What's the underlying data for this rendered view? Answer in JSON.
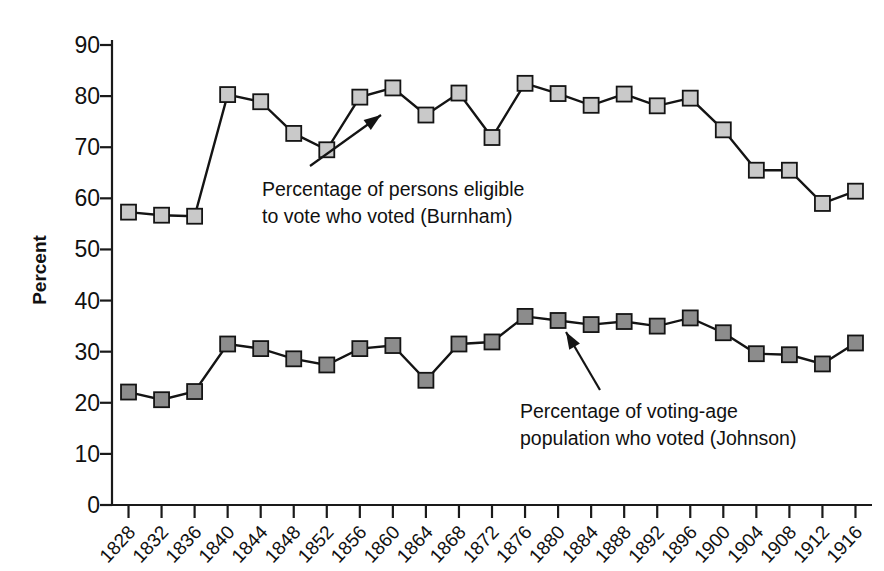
{
  "chart_data": {
    "type": "line",
    "title": "",
    "subtitle": "",
    "xlabel": "",
    "ylabel": "Percent",
    "ylim": [
      0,
      90
    ],
    "ytick_step": 10,
    "grid": false,
    "legend_position": "none",
    "categories": [
      "1828",
      "1832",
      "1836",
      "1840",
      "1844",
      "1848",
      "1852",
      "1856",
      "1860",
      "1864",
      "1868",
      "1872",
      "1876",
      "1880",
      "1884",
      "1888",
      "1892",
      "1896",
      "1900",
      "1904",
      "1908",
      "1912",
      "1916"
    ],
    "x": [
      1828,
      1832,
      1836,
      1840,
      1844,
      1848,
      1852,
      1856,
      1860,
      1864,
      1868,
      1872,
      1876,
      1880,
      1884,
      1888,
      1892,
      1896,
      1900,
      1904,
      1908,
      1912,
      1916
    ],
    "yticks": [
      0,
      10,
      20,
      30,
      40,
      50,
      60,
      70,
      80,
      90
    ],
    "series": [
      {
        "name": "Percentage of persons eligible to vote who voted (Burnham)",
        "marker_color": "#c9c9c9",
        "line_color": "#141414",
        "values": [
          57.3,
          56.7,
          56.5,
          80.3,
          78.9,
          72.7,
          69.5,
          79.8,
          81.6,
          76.3,
          80.6,
          71.9,
          82.5,
          80.5,
          78.2,
          80.4,
          78.1,
          79.6,
          73.4,
          65.5,
          65.5,
          59.0,
          61.4
        ]
      },
      {
        "name": "Percentage of voting-age population who voted (Johnson)",
        "marker_color": "#8c8c8c",
        "line_color": "#141414",
        "values": [
          22.1,
          20.6,
          22.2,
          31.5,
          30.6,
          28.6,
          27.4,
          30.6,
          31.2,
          24.4,
          31.5,
          31.9,
          36.9,
          36.1,
          35.3,
          35.9,
          35.0,
          36.6,
          33.7,
          29.6,
          29.4,
          27.6,
          31.7
        ]
      }
    ],
    "annotations": [
      {
        "id": "burnham-annotation",
        "lines": [
          "Percentage of persons eligible",
          "to vote who voted (Burnham)"
        ],
        "target_x": 1856,
        "target_y": 79.8
      },
      {
        "id": "johnson-annotation",
        "lines": [
          "Percentage of voting-age",
          "population who voted (Johnson)"
        ],
        "target_x": 1884,
        "target_y": 35.3
      }
    ]
  },
  "colors": {
    "background": "#ffffff",
    "axis": "#1a1a1a",
    "line": "#141414",
    "marker_upper": "#c9c9c9",
    "marker_lower": "#8c8c8c",
    "text": "#111111"
  }
}
